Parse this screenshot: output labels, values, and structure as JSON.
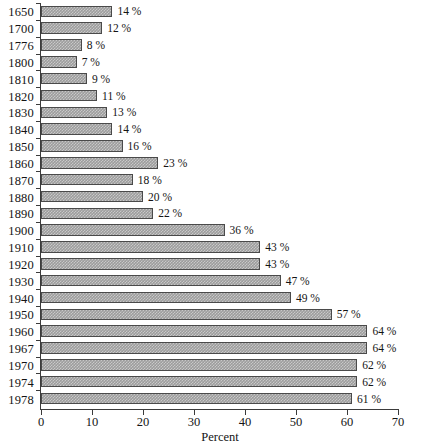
{
  "chart_data": {
    "type": "bar",
    "orientation": "horizontal",
    "title": "",
    "xlabel": "Percent",
    "ylabel": "",
    "xlim": [
      0,
      70
    ],
    "xticks": [
      0,
      10,
      20,
      30,
      40,
      50,
      60,
      70
    ],
    "grid": false,
    "legend": null,
    "value_suffix": "%",
    "categories": [
      "1650",
      "1700",
      "1776",
      "1800",
      "1810",
      "1820",
      "1830",
      "1840",
      "1850",
      "1860",
      "1870",
      "1880",
      "1890",
      "1900",
      "1910",
      "1920",
      "1930",
      "1940",
      "1950",
      "1960",
      "1967",
      "1970",
      "1974",
      "1978"
    ],
    "values": [
      14,
      12,
      8,
      7,
      9,
      11,
      13,
      14,
      16,
      23,
      18,
      20,
      22,
      36,
      43,
      43,
      47,
      49,
      57,
      64,
      64,
      62,
      62,
      61
    ],
    "data_labels": [
      "14 %",
      "12 %",
      "8 %",
      "7 %",
      "9 %",
      "11 %",
      "13 %",
      "14 %",
      "16 %",
      "23 %",
      "18 %",
      "20 %",
      "22 %",
      "36 %",
      "43 %",
      "43 %",
      "47 %",
      "49 %",
      "57 %",
      "64 %",
      "64 %",
      "62 %",
      "62 %",
      "61 %"
    ],
    "colors": {
      "bar_fill": "#9d9d9d",
      "bar_outline": "#4a4a4a",
      "axis": "#3b3b3b",
      "text": "#141414",
      "background": "#ffffff"
    }
  }
}
